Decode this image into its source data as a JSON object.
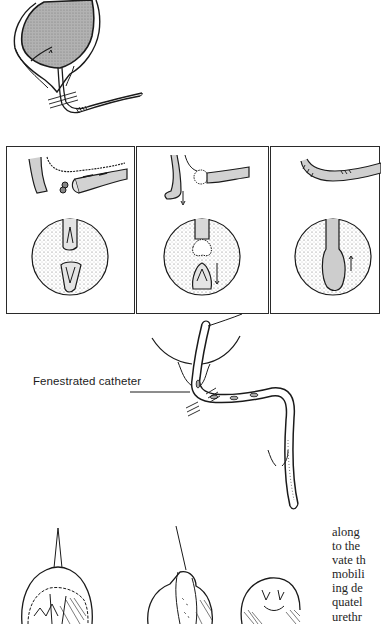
{
  "figure_top": {
    "description": "Bladder with urethral stricture, side view",
    "colors": {
      "ink": "#1a1a1a",
      "tissue_fill": "#a8a8a8"
    }
  },
  "panels": [
    {
      "index": 1,
      "description": "Excision of stricture segment; circular endoscopic view of separated ends"
    },
    {
      "index": 2,
      "description": "Spatulation of urethral ends; circular view of approximation"
    },
    {
      "index": 3,
      "description": "Completed anastomosis; circular view of healed lumen"
    }
  ],
  "catheter_figure": {
    "label": "Fenestrated catheter"
  },
  "bottom_figures": [
    {
      "description": "Perineal view with urethra exposed"
    },
    {
      "description": "Perineal view, urethral mobilization"
    },
    {
      "description": "Perineal view, closure sutures"
    }
  ],
  "body_text": {
    "lines": [
      "along",
      "to the",
      "vate th",
      "mobili",
      "ing de",
      "quatel",
      "urethr"
    ]
  }
}
